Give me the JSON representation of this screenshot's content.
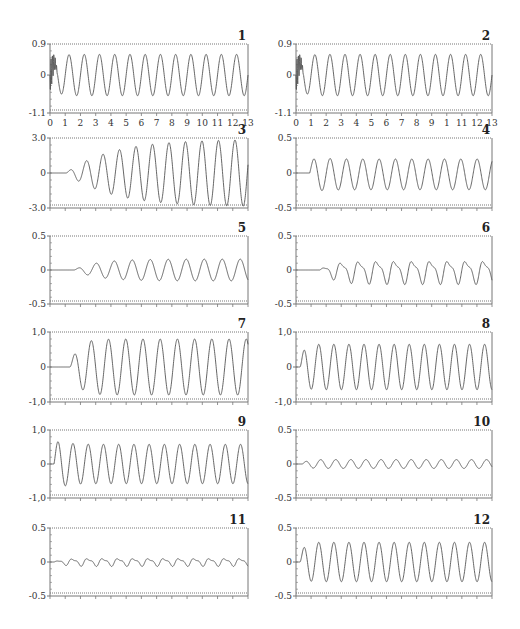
{
  "figure": {
    "layout": "6 rows x 2 columns of time-series panels",
    "line_color": "#555555",
    "frame_color": "#777777"
  },
  "chart_data": [
    {
      "id": "1",
      "type": "line",
      "label": "1",
      "ylim": [
        -1.1,
        0.9
      ],
      "yticks": [
        "0.9",
        "0",
        "-1.1"
      ],
      "xticks": [
        "0",
        "1",
        "2",
        "3",
        "4",
        "5",
        "6",
        "7",
        "8",
        "9",
        "10",
        "11",
        "12",
        "13"
      ],
      "xlim": [
        0,
        13
      ],
      "description": "steady sinusoid, ~13 cycles, amplitude ~0.6 after brief startup transient",
      "signal": {
        "delay": 0.0,
        "amp": 0.6,
        "cycles": 13,
        "ramp": 0.3,
        "offset": 0.0,
        "noise": "startup"
      }
    },
    {
      "id": "2",
      "type": "line",
      "label": "2",
      "ylim": [
        -1.1,
        0.9
      ],
      "yticks": [
        "0.9",
        "0",
        "-1.1"
      ],
      "xticks": [
        "0",
        "1",
        "2",
        "3",
        "4",
        "5",
        "6",
        "7",
        "8",
        "9",
        "1",
        "11",
        "12",
        "13"
      ],
      "xlim": [
        0,
        13
      ],
      "description": "steady sinusoid, ~13 cycles, amplitude ~0.6",
      "signal": {
        "delay": 0.0,
        "amp": 0.6,
        "cycles": 13,
        "ramp": 0.3,
        "offset": 0.0,
        "noise": "startup"
      }
    },
    {
      "id": "3",
      "type": "line",
      "label": "3",
      "ylim": [
        -3.0,
        3.0
      ],
      "yticks": [
        "3.0",
        "0",
        "-3.0"
      ],
      "xlim": [
        0,
        13
      ],
      "description": "growing sinusoid after ~0.8 delay, saturating near +/-3.0",
      "signal": {
        "delay": 0.08,
        "amp": 2.9,
        "cycles": 12,
        "ramp": 3.0,
        "offset": 0.0
      }
    },
    {
      "id": "4",
      "type": "line",
      "label": "4",
      "ylim": [
        -0.5,
        0.5
      ],
      "yticks": [
        "0.5",
        "0",
        "-0.5"
      ],
      "xlim": [
        0,
        13
      ],
      "description": "after delay, overshoot to ~0.35 then steady oscillation ~+/-0.22",
      "signal": {
        "delay": 0.07,
        "amp": 0.22,
        "cycles": 12,
        "ramp": 0.3,
        "offset": -0.02,
        "overshoot": 0.14
      }
    },
    {
      "id": "5",
      "type": "line",
      "label": "5",
      "ylim": [
        -0.5,
        0.5
      ],
      "yticks": [
        "0.5",
        "0",
        "-0.5"
      ],
      "xlim": [
        0,
        13
      ],
      "description": "small irregular start then oscillation ~+/-0.17",
      "signal": {
        "delay": 0.12,
        "amp": 0.16,
        "cycles": 11,
        "ramp": 1.5,
        "offset": 0.0
      }
    },
    {
      "id": "6",
      "type": "line",
      "label": "6",
      "ylim": [
        -0.5,
        0.5
      ],
      "yticks": [
        "0.5",
        "0",
        "-0.5"
      ],
      "xlim": [
        0,
        13
      ],
      "description": "irregular double-peaked oscillation ~+/-0.2 after delay",
      "signal": {
        "delay": 0.12,
        "amp": 0.18,
        "cycles": 11,
        "ramp": 0.8,
        "offset": -0.02,
        "harmonic": 0.35
      }
    },
    {
      "id": "7",
      "type": "line",
      "label": "7",
      "ylim": [
        -1.0,
        1.0
      ],
      "yticks": [
        "1,0",
        "0",
        "-1,0"
      ],
      "xlim": [
        0,
        13
      ],
      "description": "after delay, sinusoid amplitude ~0.8",
      "signal": {
        "delay": 0.1,
        "amp": 0.8,
        "cycles": 11.5,
        "ramp": 0.5,
        "offset": 0.0
      }
    },
    {
      "id": "8",
      "type": "line",
      "label": "8",
      "ylim": [
        -1.0,
        1.0
      ],
      "yticks": [
        "1,0",
        "0",
        "-1,0"
      ],
      "xlim": [
        0,
        13
      ],
      "description": "sinusoid amplitude ~0.65, early peak ~0.75",
      "signal": {
        "delay": 0.02,
        "amp": 0.65,
        "cycles": 13,
        "ramp": 0.2,
        "offset": 0.0
      }
    },
    {
      "id": "9",
      "type": "line",
      "label": "9",
      "ylim": [
        -1.0,
        1.0
      ],
      "yticks": [
        "1,0",
        "0",
        "-1,0"
      ],
      "xlim": [
        0,
        13
      ],
      "description": "early spike ~0.85 then sinusoid ~+/-0.6",
      "signal": {
        "delay": 0.02,
        "amp": 0.58,
        "cycles": 13,
        "ramp": 0.15,
        "offset": 0.0,
        "overshoot": 0.3
      }
    },
    {
      "id": "10",
      "type": "line",
      "label": "10",
      "ylim": [
        -0.5,
        0.5
      ],
      "yticks": [
        "0.5",
        "0",
        "-0.5"
      ],
      "xlim": [
        0,
        13
      ],
      "description": "small oscillation ~+/-0.07",
      "signal": {
        "delay": 0.03,
        "amp": 0.065,
        "cycles": 13,
        "ramp": 0.3,
        "offset": 0.0
      }
    },
    {
      "id": "11",
      "type": "line",
      "label": "11",
      "ylim": [
        -0.5,
        0.5
      ],
      "yticks": [
        "0.5",
        "0",
        "-0.5"
      ],
      "xlim": [
        0,
        13
      ],
      "description": "small irregular sawtooth-like oscillation ~+/-0.07",
      "signal": {
        "delay": 0.02,
        "amp": 0.06,
        "cycles": 13,
        "ramp": 0.5,
        "offset": 0.0,
        "harmonic": 0.4
      }
    },
    {
      "id": "12",
      "type": "line",
      "label": "12",
      "ylim": [
        -0.5,
        0.5
      ],
      "yticks": [
        "0.5",
        "0",
        "-0.5"
      ],
      "xlim": [
        0,
        13
      ],
      "description": "oscillation ~+/-0.3 after brief dip",
      "signal": {
        "delay": 0.02,
        "amp": 0.29,
        "cycles": 13,
        "ramp": 0.2,
        "offset": 0.0
      }
    }
  ]
}
